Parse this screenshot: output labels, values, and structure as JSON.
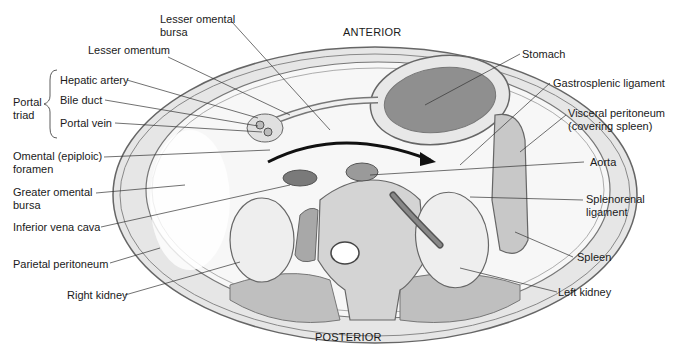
{
  "orientation": {
    "top": "ANTERIOR",
    "bottom": "POSTERIOR"
  },
  "group": {
    "label_line1": "Portal",
    "label_line2": "triad",
    "members": [
      "Hepatic artery",
      "Bile duct",
      "Portal vein"
    ]
  },
  "labels_left": [
    {
      "line1": "Lesser omental",
      "line2": "bursa"
    },
    {
      "line1": "Lesser omentum"
    },
    {
      "line1": "Omental (epiploic)",
      "line2": "foramen"
    },
    {
      "line1": "Greater omental",
      "line2": "bursa"
    },
    {
      "line1": "Inferior vena cava"
    },
    {
      "line1": "Parietal peritoneum"
    },
    {
      "line1": "Right kidney"
    }
  ],
  "labels_right": [
    {
      "line1": "Stomach"
    },
    {
      "line1": "Gastrosplenic ligament"
    },
    {
      "line1": "Visceral peritoneum",
      "line2": "(covering spleen)"
    },
    {
      "line1": "Aorta"
    },
    {
      "line1": "Splenorenal",
      "line2": "ligament"
    },
    {
      "line1": "Spleen"
    },
    {
      "line1": "Left kidney"
    }
  ]
}
